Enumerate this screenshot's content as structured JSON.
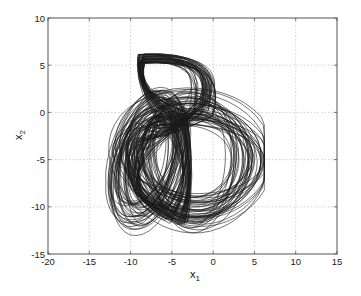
{
  "chart_data": {
    "type": "line",
    "title": "",
    "xlabel": "x",
    "xlabel_sub": "1",
    "ylabel": "x",
    "ylabel_sub": "2",
    "xlim": [
      -20,
      15
    ],
    "ylim": [
      -15,
      10
    ],
    "xticks": [
      -20,
      -15,
      -10,
      -5,
      0,
      5,
      10,
      15
    ],
    "yticks": [
      -15,
      -10,
      -5,
      0,
      5,
      10
    ],
    "xtick_labels": [
      "-20",
      "-15",
      "-10",
      "-5",
      "0",
      "5",
      "10",
      "15"
    ],
    "ytick_labels": [
      "-15",
      "-10",
      "-5",
      "0",
      "5",
      "10"
    ],
    "grid": true,
    "legend": null,
    "extent": {
      "x_min": -13.0,
      "x_max": 6.2,
      "y_min": -13.3,
      "y_max": 6.3
    },
    "line_color": "#1a1a1a"
  }
}
